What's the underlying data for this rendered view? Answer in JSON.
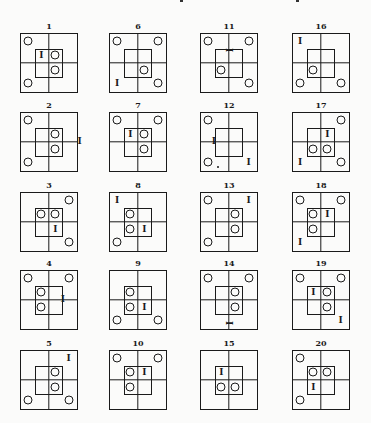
{
  "legend": {
    "circle": "circle marker",
    "bar": "I-shaped bar marker"
  },
  "figures": [
    {
      "label": "1",
      "circles": [
        "tl",
        "bl",
        "itr",
        "ibr"
      ],
      "bars": [
        {
          "pos": "itl",
          "orient": "v"
        }
      ]
    },
    {
      "label": "2",
      "circles": [
        "tl",
        "bl",
        "itr",
        "ibr"
      ],
      "bars": [
        {
          "pos": "right-edge-mid",
          "orient": "v"
        }
      ]
    },
    {
      "label": "3",
      "circles": [
        "tr",
        "br",
        "itl",
        "itr"
      ],
      "bars": [
        {
          "pos": "ibr",
          "orient": "v"
        }
      ]
    },
    {
      "label": "4",
      "circles": [
        "tl",
        "tr",
        "itl",
        "ibl"
      ],
      "bars": [
        {
          "pos": "inner-right-mid",
          "orient": "v"
        }
      ]
    },
    {
      "label": "5",
      "circles": [
        "bl",
        "br",
        "itr",
        "ibr"
      ],
      "bars": [
        {
          "pos": "tr",
          "orient": "v"
        }
      ]
    },
    {
      "label": "6",
      "circles": [
        "tl",
        "tr",
        "br",
        "ibr"
      ],
      "bars": [
        {
          "pos": "bl",
          "orient": "v"
        }
      ]
    },
    {
      "label": "7",
      "circles": [
        "tl",
        "tr",
        "itr",
        "ibr"
      ],
      "bars": [
        {
          "pos": "itl",
          "orient": "v"
        }
      ]
    },
    {
      "label": "8",
      "circles": [
        "bl",
        "itl",
        "ibl"
      ],
      "bars": [
        {
          "pos": "tl",
          "orient": "v"
        },
        {
          "pos": "ibr",
          "orient": "v"
        }
      ]
    },
    {
      "label": "9",
      "circles": [
        "bl",
        "br",
        "itl",
        "ibl"
      ],
      "bars": [
        {
          "pos": "ibr",
          "orient": "v"
        }
      ]
    },
    {
      "label": "10",
      "circles": [
        "tl",
        "tr",
        "itl",
        "ibl"
      ],
      "bars": [
        {
          "pos": "itr",
          "orient": "v"
        }
      ]
    },
    {
      "label": "11",
      "circles": [
        "tl",
        "tr",
        "br",
        "ibl"
      ],
      "bars": [
        {
          "pos": "inner-top-mid",
          "orient": "h"
        }
      ]
    },
    {
      "label": "12",
      "circles": [
        "tl",
        "bl"
      ],
      "bars": [
        {
          "pos": "inner-left-mid",
          "orient": "v"
        },
        {
          "pos": "br",
          "orient": "v"
        }
      ],
      "dots": [
        "bl-right"
      ]
    },
    {
      "label": "13",
      "circles": [
        "tl",
        "bl",
        "itr",
        "ibr"
      ],
      "bars": [
        {
          "pos": "tr",
          "orient": "v"
        }
      ]
    },
    {
      "label": "14",
      "circles": [
        "tl",
        "tr",
        "itr",
        "ibr"
      ],
      "bars": [
        {
          "pos": "bottom-mid",
          "orient": "h"
        }
      ]
    },
    {
      "label": "15",
      "circles": [
        "ibl",
        "ibr"
      ],
      "bars": [
        {
          "pos": "itl",
          "orient": "v"
        }
      ]
    },
    {
      "label": "16",
      "circles": [
        "bl",
        "br",
        "ibl"
      ],
      "bars": [
        {
          "pos": "tl",
          "orient": "v"
        }
      ]
    },
    {
      "label": "17",
      "circles": [
        "tr",
        "br",
        "ibl",
        "ibr"
      ],
      "bars": [
        {
          "pos": "itr",
          "orient": "v"
        },
        {
          "pos": "bl",
          "orient": "v"
        }
      ]
    },
    {
      "label": "18",
      "circles": [
        "tl",
        "tr",
        "itl",
        "ibl"
      ],
      "bars": [
        {
          "pos": "itr",
          "orient": "v"
        },
        {
          "pos": "bl",
          "orient": "v"
        }
      ]
    },
    {
      "label": "19",
      "circles": [
        "tl",
        "tr",
        "itr",
        "ibr"
      ],
      "bars": [
        {
          "pos": "itl",
          "orient": "v"
        },
        {
          "pos": "br",
          "orient": "v"
        }
      ]
    },
    {
      "label": "20",
      "circles": [
        "tl",
        "bl",
        "itl",
        "itr"
      ],
      "bars": [
        {
          "pos": "ibl",
          "orient": "v"
        }
      ]
    }
  ]
}
